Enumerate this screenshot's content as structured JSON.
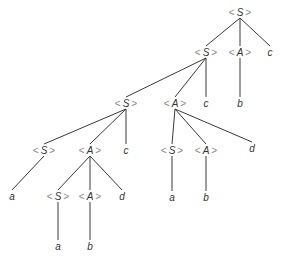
{
  "diagram": {
    "type": "parse-tree",
    "nodes": [
      {
        "id": "n0",
        "symbol": "S",
        "kind": "nonterminal",
        "x": 240,
        "y": 12
      },
      {
        "id": "n1",
        "symbol": "S",
        "kind": "nonterminal",
        "x": 206,
        "y": 52
      },
      {
        "id": "n2",
        "symbol": "A",
        "kind": "nonterminal",
        "x": 240,
        "y": 52
      },
      {
        "id": "n3",
        "symbol": "c",
        "kind": "terminal",
        "x": 270,
        "y": 52
      },
      {
        "id": "n4",
        "symbol": "S",
        "kind": "nonterminal",
        "x": 126,
        "y": 103
      },
      {
        "id": "n5",
        "symbol": "A",
        "kind": "nonterminal",
        "x": 175,
        "y": 103
      },
      {
        "id": "n6",
        "symbol": "c",
        "kind": "terminal",
        "x": 206,
        "y": 103
      },
      {
        "id": "n7",
        "symbol": "b",
        "kind": "terminal",
        "x": 240,
        "y": 103
      },
      {
        "id": "n8",
        "symbol": "S",
        "kind": "nonterminal",
        "x": 44,
        "y": 150
      },
      {
        "id": "n9",
        "symbol": "A",
        "kind": "nonterminal",
        "x": 90,
        "y": 150
      },
      {
        "id": "n10",
        "symbol": "c",
        "kind": "terminal",
        "x": 126,
        "y": 150
      },
      {
        "id": "n11",
        "symbol": "S",
        "kind": "nonterminal",
        "x": 172,
        "y": 150
      },
      {
        "id": "n12",
        "symbol": "A",
        "kind": "nonterminal",
        "x": 206,
        "y": 150
      },
      {
        "id": "n13",
        "symbol": "d",
        "kind": "terminal",
        "x": 252,
        "y": 148
      },
      {
        "id": "n14",
        "symbol": "a",
        "kind": "terminal",
        "x": 12,
        "y": 196
      },
      {
        "id": "n15",
        "symbol": "S",
        "kind": "nonterminal",
        "x": 58,
        "y": 196
      },
      {
        "id": "n16",
        "symbol": "A",
        "kind": "nonterminal",
        "x": 90,
        "y": 196
      },
      {
        "id": "n17",
        "symbol": "d",
        "kind": "terminal",
        "x": 122,
        "y": 196
      },
      {
        "id": "n18",
        "symbol": "a",
        "kind": "terminal",
        "x": 172,
        "y": 197
      },
      {
        "id": "n19",
        "symbol": "b",
        "kind": "terminal",
        "x": 206,
        "y": 197
      },
      {
        "id": "n20",
        "symbol": "a",
        "kind": "terminal",
        "x": 58,
        "y": 246
      },
      {
        "id": "n21",
        "symbol": "b",
        "kind": "terminal",
        "x": 90,
        "y": 246
      }
    ],
    "edges": [
      [
        "n0",
        "n1"
      ],
      [
        "n0",
        "n2"
      ],
      [
        "n0",
        "n3"
      ],
      [
        "n1",
        "n4"
      ],
      [
        "n1",
        "n5"
      ],
      [
        "n1",
        "n6"
      ],
      [
        "n2",
        "n7"
      ],
      [
        "n4",
        "n8"
      ],
      [
        "n4",
        "n9"
      ],
      [
        "n4",
        "n10"
      ],
      [
        "n5",
        "n11"
      ],
      [
        "n5",
        "n12"
      ],
      [
        "n5",
        "n13"
      ],
      [
        "n8",
        "n14"
      ],
      [
        "n9",
        "n15"
      ],
      [
        "n9",
        "n16"
      ],
      [
        "n9",
        "n17"
      ],
      [
        "n11",
        "n18"
      ],
      [
        "n12",
        "n19"
      ],
      [
        "n15",
        "n20"
      ],
      [
        "n16",
        "n21"
      ]
    ],
    "bracket_left": "<",
    "bracket_right": ">"
  }
}
